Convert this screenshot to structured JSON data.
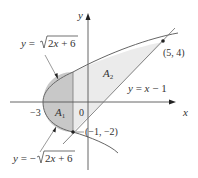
{
  "diagram": {
    "axes": {
      "x_label": "x",
      "y_label": "y",
      "origin_label": "0",
      "x_tick_label": "-3"
    },
    "curves": [
      {
        "name": "upper-parabola",
        "label": "y = √(2x + 6)",
        "label_parts": [
          "y = ",
          "2x + 6"
        ]
      },
      {
        "name": "lower-parabola",
        "label": "y = −√(2x + 6)",
        "label_parts": [
          "y = −",
          "2x + 6"
        ]
      },
      {
        "name": "line",
        "label": "y = x − 1"
      }
    ],
    "regions": [
      {
        "name": "A1",
        "label": "A",
        "subscript": "1",
        "color": "#c8c8c8"
      },
      {
        "name": "A2",
        "label": "A",
        "subscript": "2",
        "color": "#e8e8e8"
      }
    ],
    "points": [
      {
        "label": "(5, 4)",
        "x": 5,
        "y": 4
      },
      {
        "label": "(−1, −2)",
        "x": -1,
        "y": -2
      }
    ],
    "colors": {
      "region_dark": "#c8c8c8",
      "region_light": "#e8e8e8",
      "curve": "#666666",
      "axis": "#555555"
    }
  }
}
